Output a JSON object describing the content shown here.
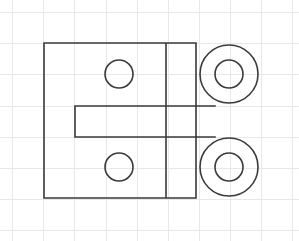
{
  "document": {
    "title": "Mechanical Part Sketch",
    "type": "engineering-line-drawing",
    "description": "Orthographic outline of a flat plate with a left side notch, two small through holes, a vertical parting line, and two large concentric circular bosses on the right separated by a rectangular notch."
  },
  "canvas": {
    "width": 299,
    "height": 241,
    "background_color": "#ffffff"
  },
  "grid": {
    "visible": true,
    "color": "#e8e8ec",
    "stroke_width": 1,
    "spacing": 31,
    "origin_x": 12,
    "origin_y": 12,
    "vertical_lines": [
      12,
      43,
      74,
      106,
      137,
      168,
      199,
      230,
      261,
      292
    ],
    "horizontal_lines": [
      12,
      43,
      74,
      106,
      137,
      168,
      199,
      230
    ]
  },
  "drawing": {
    "stroke_color": "#3a3a3a",
    "stroke_width": 1.6,
    "fill": "none",
    "body": {
      "name": "plate-outline",
      "left": 44,
      "top": 43,
      "right": 196,
      "bottom": 198,
      "notch": {
        "name": "left-notch",
        "x_inner": 75,
        "y_top": 106,
        "y_bottom": 137,
        "depth": 31,
        "height": 31
      },
      "path": "M 44 43 L 196 43 L 196 106 L 75 106 L 75 137 L 196 137 L 196 198 L 44 198 Z"
    },
    "parting_line": {
      "name": "vertical-parting-line",
      "x": 166,
      "y_top": 43,
      "y_bottom": 198
    },
    "right_notch": {
      "name": "right-notch",
      "x_left": 196,
      "y_top": 106,
      "y_bottom": 137,
      "x_right": 215
    },
    "small_holes": [
      {
        "name": "upper-left-hole",
        "cx": 119,
        "cy": 74,
        "r": 14
      },
      {
        "name": "lower-left-hole",
        "cx": 119,
        "cy": 167,
        "r": 14
      }
    ],
    "bosses": [
      {
        "name": "upper-right-boss",
        "cx": 229,
        "cy": 74,
        "outer_r": 29,
        "inner_r": 14
      },
      {
        "name": "lower-right-boss",
        "cx": 229,
        "cy": 167,
        "outer_r": 29,
        "inner_r": 14
      }
    ]
  }
}
